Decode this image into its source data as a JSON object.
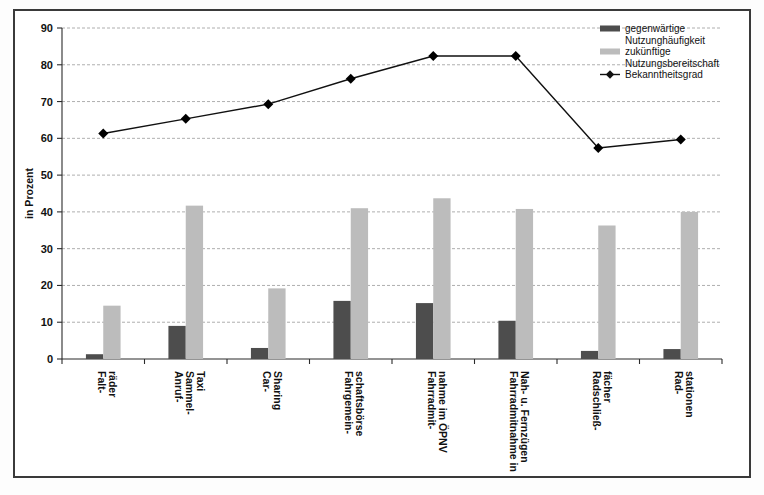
{
  "chart_data": {
    "type": "bar",
    "title": "",
    "subtitle": "",
    "xlabel": "",
    "ylabel": "in Prozent",
    "ylim": [
      0,
      90
    ],
    "ytick_step": 10,
    "yticks": [
      0,
      10,
      20,
      30,
      40,
      50,
      60,
      70,
      80,
      90
    ],
    "grid": true,
    "legend_position": "top-right",
    "categories": [
      "Falt-\nräder",
      "Anruf-\nSammel-\nTaxi",
      "Car-\nSharing",
      "Fahrgemein-\nschaftsbörse",
      "Fahrradmit-\nnahme im ÖPNV",
      "Fahrradmitnahme in\nNah- u. Fernzügen",
      "Radschließ-\nfächer",
      "Rad-\nstationen"
    ],
    "category_lines": [
      [
        "Falt-",
        "räder"
      ],
      [
        "Anruf-",
        "Sammel-",
        "Taxi"
      ],
      [
        "Car-",
        "Sharing"
      ],
      [
        "Fahrgemein-",
        "schaftsbörse"
      ],
      [
        "Fahrradmit-",
        "nahme im ÖPNV"
      ],
      [
        "Fahrradmitnahme in",
        "Nah- u. Fernzügen"
      ],
      [
        "Radschließ-",
        "fächer"
      ],
      [
        "Rad-",
        "stationen"
      ]
    ],
    "series": [
      {
        "name": "gegenwärtige Nutzunghäufigkeit",
        "type": "bar",
        "color": "#4d4d4d",
        "values": [
          1.3,
          9.0,
          3.0,
          15.8,
          15.2,
          10.4,
          2.2,
          2.7
        ]
      },
      {
        "name": "zukünftige Nutzungsbereitschaft",
        "type": "bar",
        "color": "#bcbcbc",
        "values": [
          14.5,
          41.7,
          19.2,
          41.0,
          43.7,
          40.8,
          36.3,
          40.0
        ]
      },
      {
        "name": "Bekanntheitsgrad",
        "type": "line",
        "color": "#111111",
        "marker": "diamond",
        "values": [
          61.3,
          65.3,
          69.3,
          76.2,
          82.4,
          82.4,
          57.4,
          59.7
        ]
      }
    ]
  },
  "legend": {
    "entries": [
      {
        "swatch": "dark-bar-swatch",
        "line1": "gegenwärtige",
        "line2": "Nutzunghäufigkeit"
      },
      {
        "swatch": "light-bar-swatch",
        "line1": "zukünftige",
        "line2": "Nutzungsbereitschaft"
      },
      {
        "swatch": "line-marker-swatch",
        "line1": "Bekanntheitsgrad",
        "line2": ""
      }
    ]
  },
  "axes": {
    "y_title": "in Prozent",
    "y_tick_labels": [
      "0",
      "10",
      "20",
      "30",
      "40",
      "50",
      "60",
      "70",
      "80",
      "90"
    ]
  },
  "colors": {
    "bar_current": "#4d4d4d",
    "bar_future": "#bcbcbc",
    "line": "#111111",
    "grid": "#9a9a9a",
    "axis": "#2b2b2b",
    "frame": "#3a3a3a"
  }
}
